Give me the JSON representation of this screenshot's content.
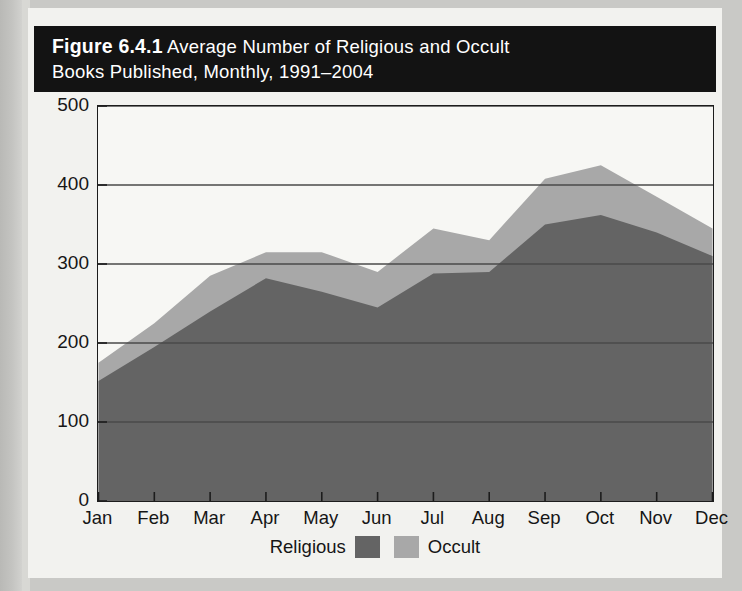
{
  "figure": {
    "number_label": "Figure 6.4.1",
    "title_line1_rest": " Average Number of Religious and Occult",
    "title_line2": "Books Published, Monthly, 1991–2004"
  },
  "colors": {
    "religious": "#646464",
    "occult": "#a8a8a8",
    "frame": "#1c1c1c",
    "gridline": "#4a4a4a",
    "plot_background": "#f7f7f4",
    "title_background": "#131313",
    "title_text": "#ffffff",
    "card_background": "#f2f2ef"
  },
  "chart_data": {
    "type": "area",
    "stacked": true,
    "title": "Figure 6.4.1 Average Number of Religious and Occult Books Published, Monthly, 1991–2004",
    "xlabel": "",
    "ylabel": "",
    "categories": [
      "Jan",
      "Feb",
      "Mar",
      "Apr",
      "May",
      "Jun",
      "Jul",
      "Aug",
      "Sep",
      "Oct",
      "Nov",
      "Dec"
    ],
    "ylim": [
      0,
      500
    ],
    "yticks": [
      0,
      100,
      200,
      300,
      400,
      500
    ],
    "ytick_labels": [
      "0",
      "100",
      "200",
      "300",
      "400",
      "500"
    ],
    "grid": true,
    "legend_position": "bottom",
    "series": [
      {
        "name": "Religious",
        "color": "#646464",
        "values": [
          152,
          195,
          240,
          282,
          265,
          245,
          288,
          290,
          350,
          362,
          340,
          310
        ]
      },
      {
        "name": "Occult",
        "color": "#a8a8a8",
        "values": [
          23,
          30,
          45,
          33,
          50,
          45,
          57,
          40,
          58,
          63,
          45,
          35
        ]
      }
    ],
    "totals": [
      175,
      225,
      285,
      315,
      315,
      290,
      345,
      330,
      408,
      425,
      385,
      345
    ]
  },
  "legend": {
    "items": [
      {
        "label": "Religious",
        "color": "#646464"
      },
      {
        "label": "Occult",
        "color": "#a8a8a8"
      }
    ]
  }
}
